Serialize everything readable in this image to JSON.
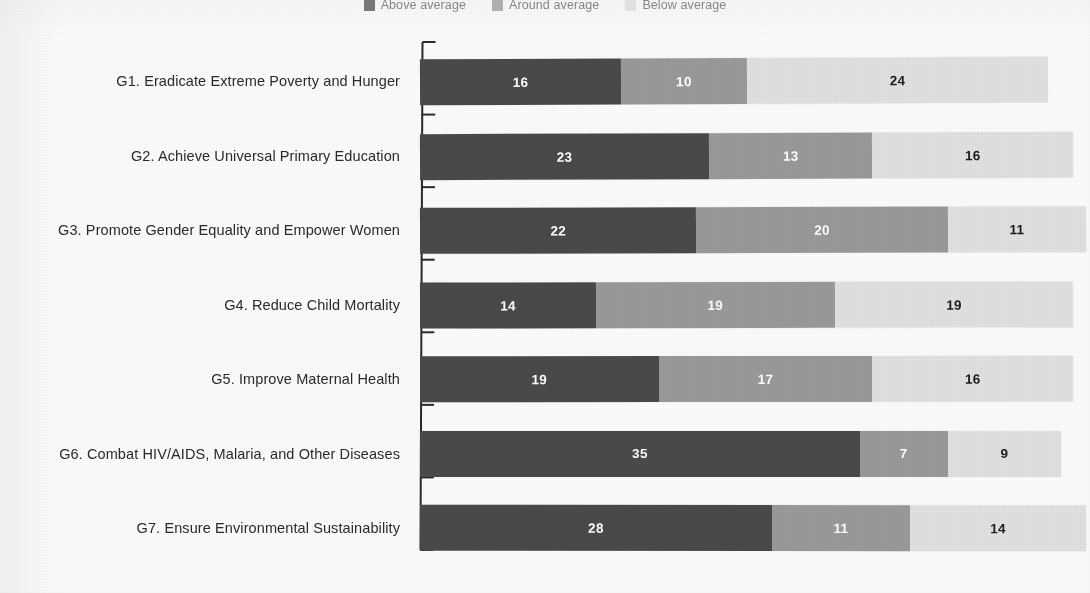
{
  "legend": {
    "position": "top-center",
    "items": [
      {
        "label": "Above average",
        "key": "above",
        "color": "#4a4a4a"
      },
      {
        "label": "Around average",
        "key": "around",
        "color": "#9a9a9a"
      },
      {
        "label": "Below average",
        "key": "below",
        "color": "#e2e2e2"
      }
    ]
  },
  "chart_data": {
    "type": "bar",
    "orientation": "horizontal",
    "stacked": true,
    "title": "",
    "subtitle": "",
    "xlabel": "",
    "ylabel": "",
    "grid": false,
    "axis": {
      "spine": "left",
      "ticks_between_categories": true
    },
    "categories": [
      "G1. Eradicate Extreme Poverty and Hunger",
      "G2. Achieve Universal Primary Education",
      "G3. Promote Gender Equality and Empower Women",
      "G4. Reduce Child Mortality",
      "G5. Improve Maternal Health",
      "G6. Combat HIV/AIDS, Malaria, and Other Diseases",
      "G7. Ensure Environmental Sustainability"
    ],
    "series": [
      {
        "name": "Above average",
        "color": "#4a4a4a",
        "values": [
          16,
          23,
          22,
          14,
          19,
          35,
          28
        ]
      },
      {
        "name": "Around average",
        "color": "#9a9a9a",
        "values": [
          10,
          13,
          20,
          19,
          17,
          7,
          11
        ]
      },
      {
        "name": "Below average",
        "color": "#e2e2e2",
        "values": [
          24,
          16,
          11,
          19,
          16,
          9,
          14
        ]
      }
    ],
    "row_totals": [
      50,
      52,
      53,
      52,
      52,
      51,
      53
    ]
  },
  "colors": {
    "above_average": "#4a4a4a",
    "around_average": "#9a9a9a",
    "below_average": "#e2e2e2",
    "axis": "#2a2a2a",
    "label_text": "#2b2b2b",
    "legend_text": "#5d5d5d",
    "background": "#fdfdfd"
  }
}
